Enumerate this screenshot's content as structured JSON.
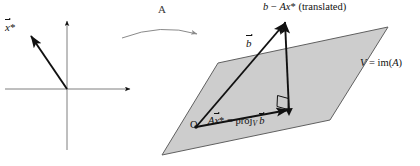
{
  "figure": {
    "title_present": false,
    "background_color": "#ffffff",
    "ink_color": "#111111",
    "plane_fill": "#cfcfcf",
    "plane_stroke": "#555555",
    "arrow_color_map": "#7b7b7b"
  },
  "left_panel": {
    "name": "domain-axes",
    "vector_label": "x⃗*",
    "vector_label_parts": {
      "letter": "x",
      "star": "*"
    },
    "axes": {
      "origin_x": 67,
      "origin_y": 89,
      "x_axis_from": 5,
      "x_axis_to": 133,
      "y_axis_top": 18,
      "y_axis_bottom": 150
    },
    "vector": {
      "from_x": 67,
      "from_y": 89,
      "to_x": 28,
      "to_y": 32
    }
  },
  "map_arrow": {
    "name": "transformation-arrow",
    "label": "A",
    "from_x": 122,
    "from_y": 37,
    "to_x": 200,
    "to_y": 33,
    "peak_y": 25
  },
  "right_panel": {
    "name": "image-plane",
    "plane_label_parts": {
      "v": "V",
      "eq": " = ",
      "im": "im(",
      "a": "A",
      "close": ")"
    },
    "plane_label": "V = im(A)",
    "origin_label": "O",
    "plane_vertices": [
      {
        "x": 218,
        "y": 63
      },
      {
        "x": 388,
        "y": 27
      },
      {
        "x": 330,
        "y": 120
      },
      {
        "x": 162,
        "y": 155
      }
    ],
    "origin_point": {
      "x": 196,
      "y": 127
    },
    "projection_point": {
      "x": 291,
      "y": 111
    },
    "b_tip": {
      "x": 286,
      "y": 19
    },
    "labels": {
      "b": "b⃗",
      "residual": "b⃗ − Ax⃗* (translated)",
      "residual_parts": {
        "b": "b",
        "minus": " − ",
        "a": "A",
        "x": "x",
        "star": "*",
        "note": " (translated)"
      },
      "projection": "Ax⃗* = proj_V b⃗",
      "projection_parts": {
        "a": "A",
        "x": "x",
        "star": "*",
        "eq": " = ",
        "proj": "proj",
        "sub": "V",
        "b": "b"
      }
    },
    "right_angle_marker": {
      "present": true,
      "size": 11
    }
  }
}
